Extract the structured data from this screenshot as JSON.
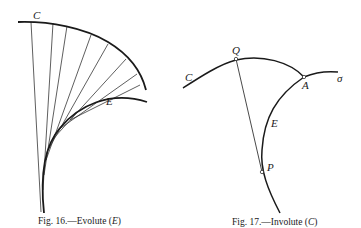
{
  "figures": [
    {
      "id": "fig16",
      "caption_prefix": "Fig. 16.—Evolute (",
      "caption_var": "E",
      "caption_suffix": ")",
      "labels": {
        "curve_c": "C",
        "curve_e": "E"
      },
      "description": "Curve C with its normals, whose envelope is the evolute E"
    },
    {
      "id": "fig17",
      "caption_prefix": "Fig. 17.—Involute (",
      "caption_var": "C",
      "caption_suffix": ")",
      "labels": {
        "curve_c": "C",
        "point_q": "Q",
        "point_a": "A",
        "curve_sigma": "σ",
        "curve_e": "E",
        "point_p": "P"
      },
      "description": "Involute C traced by point Q of a string unwound from curve E, tangent at P"
    }
  ],
  "colors": {
    "ink": "#1a1a1a",
    "paper": "#ffffff"
  }
}
